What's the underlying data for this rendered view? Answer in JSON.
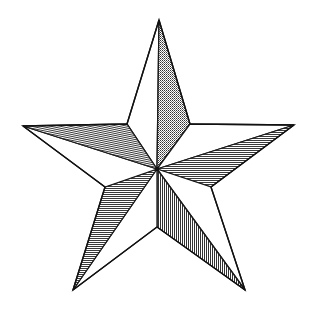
{
  "figure": {
    "style": "line art with hatched facets",
    "colors": {
      "background": "#ffffff",
      "stroke": "#1a1a1a",
      "hatch": "#222222",
      "light_facet": "#ffffff"
    },
    "center": [
      157,
      169
    ],
    "outer_points": {
      "top": [
        159,
        20
      ],
      "right": [
        294,
        125
      ],
      "bottom_right": [
        245,
        290
      ],
      "bottom_left": [
        73,
        290
      ],
      "left": [
        23,
        126
      ]
    },
    "inner_points": {
      "upper_right": [
        190,
        124
      ],
      "lower_right": [
        211,
        187
      ],
      "bottom": [
        157,
        227
      ],
      "lower_left": [
        105,
        187
      ],
      "upper_left": [
        127,
        124
      ]
    },
    "facets": [
      {
        "name": "top-left-facet",
        "shading": "light"
      },
      {
        "name": "top-right-facet",
        "shading": "checker-hatch"
      },
      {
        "name": "right-upper-facet",
        "shading": "light"
      },
      {
        "name": "right-lower-facet",
        "shading": "horizontal-hatch"
      },
      {
        "name": "bottom-right-outer-facet",
        "shading": "light"
      },
      {
        "name": "bottom-right-inner-facet",
        "shading": "vertical-hatch"
      },
      {
        "name": "bottom-left-inner-facet",
        "shading": "light"
      },
      {
        "name": "bottom-left-outer-facet",
        "shading": "horizontal-hatch"
      },
      {
        "name": "left-lower-facet",
        "shading": "light"
      },
      {
        "name": "left-upper-facet",
        "shading": "diagonal-hatch"
      }
    ]
  }
}
